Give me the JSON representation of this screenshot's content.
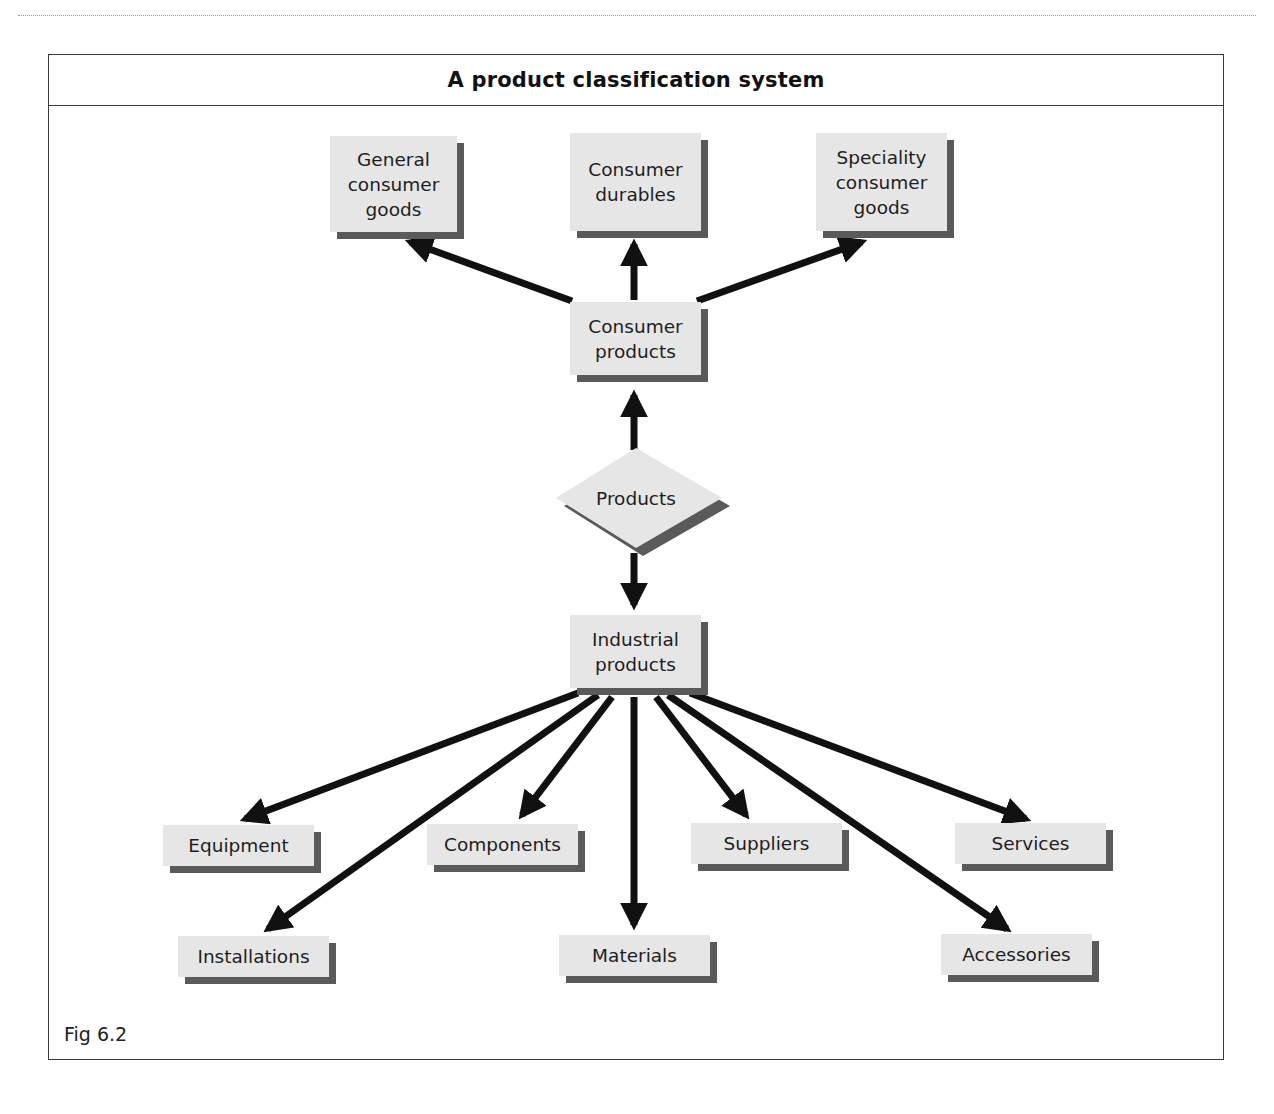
{
  "figure": {
    "title": "A product classification system",
    "caption": "Fig 6.2"
  },
  "colors": {
    "box_face": "#e6e6e6",
    "box_shadow": "#5a5a5a",
    "arrow": "#111111",
    "frame": "#3a3a3a"
  },
  "nodes": {
    "general_consumer_goods": "General\nconsumer\ngoods",
    "consumer_durables": "Consumer\ndurables",
    "speciality_consumer_goods": "Speciality\nconsumer\ngoods",
    "consumer_products": "Consumer\nproducts",
    "products": "Products",
    "industrial_products": "Industrial\nproducts",
    "equipment": "Equipment",
    "components": "Components",
    "suppliers": "Suppliers",
    "services": "Services",
    "installations": "Installations",
    "materials": "Materials",
    "accessories": "Accessories"
  },
  "edges": [
    {
      "from": "products",
      "to": "consumer_products"
    },
    {
      "from": "products",
      "to": "industrial_products"
    },
    {
      "from": "consumer_products",
      "to": "general_consumer_goods"
    },
    {
      "from": "consumer_products",
      "to": "consumer_durables"
    },
    {
      "from": "consumer_products",
      "to": "speciality_consumer_goods"
    },
    {
      "from": "industrial_products",
      "to": "equipment"
    },
    {
      "from": "industrial_products",
      "to": "installations"
    },
    {
      "from": "industrial_products",
      "to": "components"
    },
    {
      "from": "industrial_products",
      "to": "materials"
    },
    {
      "from": "industrial_products",
      "to": "suppliers"
    },
    {
      "from": "industrial_products",
      "to": "accessories"
    },
    {
      "from": "industrial_products",
      "to": "services"
    }
  ]
}
